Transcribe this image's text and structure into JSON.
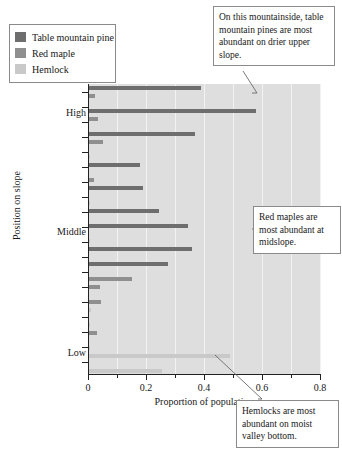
{
  "chart_data": {
    "type": "bar",
    "orientation": "horizontal",
    "title": "",
    "xlabel": "Proportion of population",
    "ylabel": "Position on slope",
    "xlim": [
      0,
      0.8
    ],
    "xticks": [
      0,
      0.2,
      0.4,
      0.6,
      0.8
    ],
    "xticklabels": [
      "0",
      "0.2",
      "0.4",
      "0.6",
      "0.8"
    ],
    "xminorticks": [
      0.1,
      0.3,
      0.5,
      0.7
    ],
    "grid": true,
    "grid_axis": "x",
    "legend_position": "upper-left-outside",
    "categories": [
      "Position 1",
      "Position 2",
      "Position 3",
      "Position 4",
      "Position 5",
      "Position 6",
      "Position 7",
      "Position 8",
      "Position 9"
    ],
    "ytickpositions": [
      "High",
      "Middle",
      "Low"
    ],
    "series": [
      {
        "name": "Table mountain pine",
        "color": "#6e6e6e",
        "values": [
          0.39,
          0.58,
          0.37,
          0.18,
          0.2,
          0.34,
          0.35,
          0.27,
          0.005
        ]
      },
      {
        "name": "Red maple",
        "color": "#8f8f8f",
        "values": [
          0.02,
          0.03,
          0.02,
          0.015,
          0.012,
          0.012,
          0.013,
          0.07,
          0.02
        ]
      },
      {
        "name": "Hemlock",
        "color": "#c9c9c9",
        "values": [
          0.005,
          0.005,
          0.005,
          0.005,
          0.005,
          0.005,
          0.005,
          0.008,
          0.49
        ]
      }
    ],
    "bars": [
      {
        "y": 2,
        "value": 0.39,
        "series": "Table mountain pine"
      },
      {
        "y": 10,
        "value": 0.025,
        "series": "Red maple"
      },
      {
        "y": 25,
        "value": 0.58,
        "series": "Table mountain pine"
      },
      {
        "y": 33,
        "value": 0.035,
        "series": "Red maple"
      },
      {
        "y": 48,
        "value": 0.37,
        "series": "Table mountain pine"
      },
      {
        "y": 56,
        "value": 0.05,
        "series": "Red maple"
      },
      {
        "y": 71,
        "value": 0.008,
        "series": "Hemlock"
      },
      {
        "y": 79,
        "value": 0.18,
        "series": "Table mountain pine"
      },
      {
        "y": 94,
        "value": 0.02,
        "series": "Red maple"
      },
      {
        "y": 102,
        "value": 0.19,
        "series": "Table mountain pine"
      },
      {
        "y": 117,
        "value": 0.006,
        "series": "Hemlock"
      },
      {
        "y": 125,
        "value": 0.245,
        "series": "Table mountain pine"
      },
      {
        "y": 140,
        "value": 0.345,
        "series": "Table mountain pine"
      },
      {
        "y": 155,
        "value": 0.008,
        "series": "Hemlock"
      },
      {
        "y": 163,
        "value": 0.36,
        "series": "Table mountain pine"
      },
      {
        "y": 178,
        "value": 0.275,
        "series": "Table mountain pine"
      },
      {
        "y": 193,
        "value": 0.15,
        "series": "Red maple"
      },
      {
        "y": 201,
        "value": 0.04,
        "series": "Red maple"
      },
      {
        "y": 216,
        "value": 0.045,
        "series": "Red maple"
      },
      {
        "y": 224,
        "value": 0.012,
        "series": "Hemlock"
      },
      {
        "y": 239,
        "value": 0.008,
        "series": "Hemlock"
      },
      {
        "y": 247,
        "value": 0.03,
        "series": "Red maple"
      },
      {
        "y": 262,
        "value": 0.005,
        "series": "Hemlock"
      },
      {
        "y": 270,
        "value": 0.49,
        "series": "Hemlock"
      },
      {
        "y": 285,
        "value": 0.255,
        "series": "Hemlock"
      }
    ]
  },
  "legend": {
    "items": [
      {
        "label": "Table mountain pine",
        "color": "#6e6e6e"
      },
      {
        "label": "Red maple",
        "color": "#8f8f8f"
      },
      {
        "label": "Hemlock",
        "color": "#c9c9c9"
      }
    ]
  },
  "axes": {
    "xlabel": "Proportion of population",
    "ylabel": "Position on slope",
    "xticklabels": [
      "0",
      "0.2",
      "0.4",
      "0.6",
      "0.8"
    ],
    "yticklabels": [
      "High",
      "Middle",
      "Low"
    ]
  },
  "callouts": {
    "pine": "On this mountainside, table mountain pines are most abundant on drier upper slope.",
    "maple": "Red maples are most abundant at midslope.",
    "hemlock": "Hemlocks are most abundant on moist valley bottom."
  },
  "colors": {
    "plot_background": "#dedede",
    "gridline": "#f2f2f2",
    "axis": "#222222",
    "pine": "#6e6e6e",
    "maple": "#8f8f8f",
    "hemlock": "#c9c9c9"
  }
}
